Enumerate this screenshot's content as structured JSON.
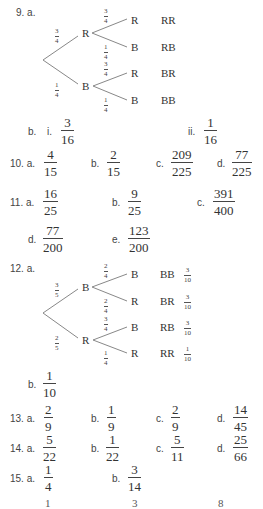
{
  "q9": {
    "number": "9. a.",
    "tree": {
      "first_branches": [
        {
          "node": "R",
          "prob": {
            "num": "3",
            "den": "4"
          }
        },
        {
          "node": "B",
          "prob": {
            "num": "1",
            "den": "4"
          }
        }
      ],
      "second_branches": [
        {
          "node": "R",
          "prob": {
            "num": "3",
            "den": "4"
          },
          "outcome": "RR"
        },
        {
          "node": "B",
          "prob": {
            "num": "1",
            "den": "4"
          },
          "outcome": "RB"
        },
        {
          "node": "R",
          "prob": {
            "num": "3",
            "den": "4"
          },
          "outcome": "BR"
        },
        {
          "node": "B",
          "prob": {
            "num": "1",
            "den": "4"
          },
          "outcome": "BB"
        }
      ]
    },
    "b_label": "b.",
    "b_i_label": "i.",
    "b_i": {
      "num": "3",
      "den": "16"
    },
    "b_ii_label": "ii.",
    "b_ii": {
      "num": "1",
      "den": "16"
    }
  },
  "q10": {
    "number": "10. a.",
    "a": {
      "num": "4",
      "den": "15"
    },
    "b_label": "b.",
    "b": {
      "num": "2",
      "den": "15"
    },
    "c_label": "c.",
    "c": {
      "num": "209",
      "den": "225"
    },
    "d_label": "d.",
    "d": {
      "num": "77",
      "den": "225"
    }
  },
  "q11": {
    "number": "11. a.",
    "a": {
      "num": "16",
      "den": "25"
    },
    "b_label": "b.",
    "b": {
      "num": "9",
      "den": "25"
    },
    "c_label": "c.",
    "c": {
      "num": "391",
      "den": "400"
    },
    "d_label": "d.",
    "d": {
      "num": "77",
      "den": "200"
    },
    "e_label": "e.",
    "e": {
      "num": "123",
      "den": "200"
    }
  },
  "q12": {
    "number": "12. a.",
    "tree": {
      "first_branches": [
        {
          "node": "B",
          "prob": {
            "num": "3",
            "den": "5"
          }
        },
        {
          "node": "R",
          "prob": {
            "num": "2",
            "den": "5"
          }
        }
      ],
      "second_branches": [
        {
          "node": "B",
          "prob": {
            "num": "2",
            "den": "4"
          },
          "outcome": "BB",
          "outcome_prob": {
            "num": "3",
            "den": "10"
          }
        },
        {
          "node": "R",
          "prob": {
            "num": "2",
            "den": "4"
          },
          "outcome": "BR",
          "outcome_prob": {
            "num": "3",
            "den": "10"
          }
        },
        {
          "node": "B",
          "prob": {
            "num": "3",
            "den": "4"
          },
          "outcome": "RB",
          "outcome_prob": {
            "num": "3",
            "den": "10"
          }
        },
        {
          "node": "R",
          "prob": {
            "num": "1",
            "den": "4"
          },
          "outcome": "RR",
          "outcome_prob": {
            "num": "1",
            "den": "10"
          }
        }
      ]
    },
    "b_label": "b.",
    "b": {
      "num": "1",
      "den": "10"
    }
  },
  "q13": {
    "number": "13. a.",
    "a": {
      "num": "2",
      "den": "9"
    },
    "b_label": "b.",
    "b": {
      "num": "1",
      "den": "9"
    },
    "c_label": "c.",
    "c": {
      "num": "2",
      "den": "9"
    },
    "d_label": "d.",
    "d": {
      "num": "14",
      "den": "45"
    }
  },
  "q14": {
    "number": "14. a.",
    "a": {
      "num": "5",
      "den": "22"
    },
    "b_label": "b.",
    "b": {
      "num": "1",
      "den": "22"
    },
    "c_label": "c.",
    "c": {
      "num": "5",
      "den": "11"
    },
    "d_label": "d.",
    "d": {
      "num": "25",
      "den": "66"
    }
  },
  "q15": {
    "number": "15. a.",
    "a": {
      "num": "1",
      "den": "4"
    },
    "b_label": "b.",
    "b": {
      "num": "3",
      "den": "14"
    }
  },
  "cutoff_row": {
    "left": "1",
    "middle": "3",
    "right": "8"
  }
}
